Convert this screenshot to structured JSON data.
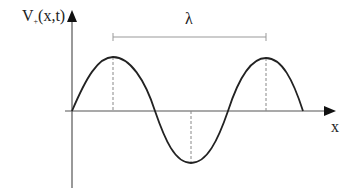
{
  "diagram": {
    "y_axis_label": "V",
    "y_axis_subscript": "+",
    "y_axis_args": "(x,t)",
    "x_axis_label": "x",
    "wavelength_label": "λ",
    "colors": {
      "curve": "#222222",
      "axis": "#555555",
      "dashed": "#888888",
      "bracket": "#999999"
    },
    "wave": {
      "start_x": 72,
      "end_x": 303,
      "baseline_y": 111,
      "peak1": {
        "x": 113,
        "y": 57
      },
      "trough": {
        "x": 191,
        "y": 163
      },
      "peak2": {
        "x": 266,
        "y": 58
      }
    }
  }
}
